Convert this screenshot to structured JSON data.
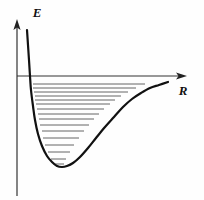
{
  "figure": {
    "background_color": "#fefefe",
    "curve_color": "#111111",
    "level_color": "#555555",
    "axis_color": "#333333"
  },
  "axes": {
    "y_axis": {
      "name": "E",
      "label": "E",
      "description": "energy axis, vertical, arrow pointing up",
      "arrow": "up",
      "x_px": 17,
      "top_px": 20,
      "bottom_px": 196
    },
    "x_axis": {
      "name": "R",
      "label": "R",
      "description": "internuclear distance axis, horizontal, arrow pointing right",
      "arrow": "right",
      "y_px": 76,
      "left_px": 17,
      "right_px": 186
    }
  },
  "chart_data": {
    "type": "line",
    "title": "",
    "xlabel": "R",
    "ylabel": "E",
    "grid": false,
    "legend": null,
    "xlim": [
      17,
      186
    ],
    "ylim_px": [
      20,
      196
    ],
    "zero_energy_px": 76,
    "annotations": [
      "E axis label at top left",
      "R axis label at right of horizontal arrow",
      "Energy zero line is the R axis; bound levels lie below it"
    ],
    "potential_curve": {
      "name": "morse-potential",
      "description": "Steep repulsive wall at small R, minimum near R=62px, asymptotic approach to dissociation limit at large R",
      "minimum_px": [
        62,
        167
      ],
      "left_wall_top_px": [
        27,
        30
      ],
      "right_tail_end_px": [
        168,
        82
      ],
      "points_px": [
        [
          27,
          30
        ],
        [
          28,
          45
        ],
        [
          29,
          60
        ],
        [
          30,
          76
        ],
        [
          31,
          90
        ],
        [
          33,
          106
        ],
        [
          35,
          120
        ],
        [
          38,
          134
        ],
        [
          42,
          146
        ],
        [
          47,
          156
        ],
        [
          52,
          162
        ],
        [
          57,
          166
        ],
        [
          62,
          167
        ],
        [
          67,
          166
        ],
        [
          73,
          163
        ],
        [
          80,
          157
        ],
        [
          88,
          148
        ],
        [
          96,
          138
        ],
        [
          105,
          127
        ],
        [
          114,
          117
        ],
        [
          123,
          107
        ],
        [
          132,
          99
        ],
        [
          141,
          93
        ],
        [
          150,
          88
        ],
        [
          159,
          85
        ],
        [
          168,
          82
        ]
      ]
    },
    "energy_levels": {
      "count": 16,
      "description": "Horizontal vibrational levels spanning the well width, converging toward the dissociation limit",
      "levels_px": [
        {
          "v": 15,
          "y": 84,
          "x_left": 33,
          "x_right": 145
        },
        {
          "v": 14,
          "y": 88,
          "x_left": 33,
          "x_right": 136
        },
        {
          "v": 13,
          "y": 92,
          "x_left": 34,
          "x_right": 128
        },
        {
          "v": 12,
          "y": 96,
          "x_left": 35,
          "x_right": 121
        },
        {
          "v": 11,
          "y": 100,
          "x_left": 35,
          "x_right": 115
        },
        {
          "v": 10,
          "y": 104,
          "x_left": 36,
          "x_right": 110
        },
        {
          "v": 9,
          "y": 109,
          "x_left": 37,
          "x_right": 104
        },
        {
          "v": 8,
          "y": 114,
          "x_left": 38,
          "x_right": 99
        },
        {
          "v": 7,
          "y": 119,
          "x_left": 39,
          "x_right": 94
        },
        {
          "v": 6,
          "y": 125,
          "x_left": 40,
          "x_right": 89
        },
        {
          "v": 5,
          "y": 131,
          "x_left": 42,
          "x_right": 84
        },
        {
          "v": 4,
          "y": 138,
          "x_left": 43,
          "x_right": 79
        },
        {
          "v": 3,
          "y": 145,
          "x_left": 45,
          "x_right": 74
        },
        {
          "v": 2,
          "y": 152,
          "x_left": 48,
          "x_right": 70
        },
        {
          "v": 1,
          "y": 159,
          "x_left": 51,
          "x_right": 66
        },
        {
          "v": 0,
          "y": 164,
          "x_left": 55,
          "x_right": 64
        }
      ]
    }
  }
}
